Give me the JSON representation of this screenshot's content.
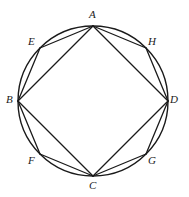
{
  "figure": {
    "kind": "geometry-diagram",
    "background_color": "#ffffff",
    "stroke_color": "#1a1a1a",
    "label_color": "#1a1a1a",
    "circle": {
      "center_x": 93,
      "center_y": 101,
      "radius": 75,
      "stroke_width": 1.4
    },
    "points": [
      {
        "id": "A",
        "label": "A",
        "x": 93,
        "y": 26,
        "label_x": 89,
        "label_y": 9
      },
      {
        "id": "E",
        "label": "E",
        "x": 40,
        "y": 48,
        "label_x": 28,
        "label_y": 36
      },
      {
        "id": "B",
        "label": "B",
        "x": 18,
        "y": 101,
        "label_x": 6,
        "label_y": 94
      },
      {
        "id": "F",
        "label": "F",
        "x": 40,
        "y": 154,
        "label_x": 28,
        "label_y": 155
      },
      {
        "id": "C",
        "label": "C",
        "x": 93,
        "y": 176,
        "label_x": 89,
        "label_y": 180
      },
      {
        "id": "G",
        "label": "G",
        "x": 146,
        "y": 154,
        "label_x": 148,
        "label_y": 155
      },
      {
        "id": "D",
        "label": "D",
        "x": 168,
        "y": 101,
        "label_x": 170,
        "label_y": 94
      },
      {
        "id": "H",
        "label": "H",
        "x": 146,
        "y": 48,
        "label_x": 148,
        "label_y": 36
      }
    ],
    "square": {
      "name": "inscribed-square",
      "vertices": [
        "A",
        "B",
        "C",
        "D"
      ],
      "edges": [
        [
          "A",
          "B"
        ],
        [
          "B",
          "C"
        ],
        [
          "C",
          "D"
        ],
        [
          "D",
          "A"
        ]
      ],
      "stroke_width": 1.3
    },
    "octagon": {
      "name": "inscribed-octagon",
      "vertices": [
        "A",
        "E",
        "B",
        "F",
        "C",
        "G",
        "D",
        "H"
      ],
      "edges": [
        [
          "A",
          "E"
        ],
        [
          "E",
          "B"
        ],
        [
          "B",
          "F"
        ],
        [
          "F",
          "C"
        ],
        [
          "C",
          "G"
        ],
        [
          "G",
          "D"
        ],
        [
          "D",
          "H"
        ],
        [
          "H",
          "A"
        ]
      ],
      "stroke_width": 1.3
    }
  }
}
